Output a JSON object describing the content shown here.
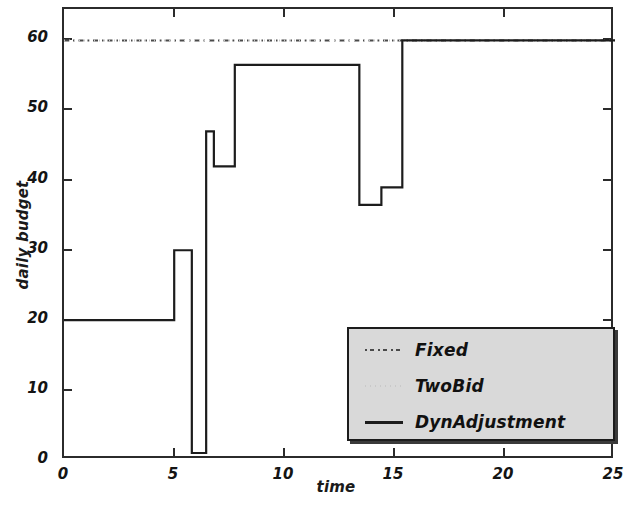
{
  "chart_data": {
    "type": "line",
    "title": "",
    "xlabel": "time",
    "ylabel": "daily budget",
    "xlim": [
      0,
      25
    ],
    "ylim": [
      0,
      64.5
    ],
    "xticks": [
      0,
      5,
      10,
      15,
      20,
      25
    ],
    "yticks": [
      0,
      10,
      20,
      30,
      40,
      50,
      60
    ],
    "xtick_labels": [
      "0",
      "5",
      "10",
      "15",
      "20",
      "25"
    ],
    "ytick_labels": [
      "0",
      "10",
      "20",
      "30",
      "40",
      "50",
      "60"
    ],
    "grid": false,
    "legend_position": "lower right",
    "series": [
      {
        "name": "Fixed",
        "style": "dashdot",
        "color": "#4a4a4a",
        "x": [
          0,
          25
        ],
        "values": [
          60,
          60
        ]
      },
      {
        "name": "TwoBid",
        "style": "dotted",
        "color": "#c9c9c9",
        "x": [
          0,
          25
        ],
        "values": [
          60,
          60
        ]
      },
      {
        "name": "DynAdjustment",
        "style": "solid",
        "color": "#1c1c1c",
        "step": "post",
        "x": [
          0,
          5.0,
          5.0,
          5.8,
          5.8,
          6.45,
          6.45,
          6.8,
          6.8,
          7.75,
          7.75,
          8.3,
          8.3,
          13.4,
          13.4,
          14.4,
          14.4,
          14.9,
          14.9,
          15.35,
          15.35,
          25
        ],
        "values": [
          20,
          20,
          30,
          30,
          1,
          1,
          47,
          47,
          42,
          42,
          56.5,
          56.5,
          56.5,
          56.5,
          36.5,
          36.5,
          39,
          39,
          39,
          39,
          60,
          60
        ]
      }
    ]
  },
  "legend": {
    "entries": [
      {
        "label": "Fixed",
        "icon": "dashdot-line-icon"
      },
      {
        "label": "TwoBid",
        "icon": "dotted-line-icon"
      },
      {
        "label": "DynAdjustment",
        "icon": "solid-line-icon"
      }
    ]
  }
}
